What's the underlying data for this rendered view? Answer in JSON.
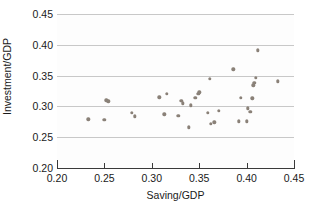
{
  "chart_data": {
    "type": "scatter",
    "title": "",
    "xlabel": "Saving/GDP",
    "ylabel": "Investment/GDP",
    "xlim": [
      0.2,
      0.45
    ],
    "ylim": [
      0.2,
      0.45
    ],
    "xticks": [
      "0.20",
      "0.25",
      "0.30",
      "0.35",
      "0.40",
      "0.45"
    ],
    "xtick_values": [
      0.2,
      0.25,
      0.3,
      0.35,
      0.4,
      0.45
    ],
    "yticks": [
      "0.20",
      "0.25",
      "0.30",
      "0.35",
      "0.40",
      "0.45"
    ],
    "ytick_values": [
      0.2,
      0.25,
      0.3,
      0.35,
      0.4,
      0.45
    ],
    "grid": "horizontal",
    "legend": null,
    "marker_color": "#8a8178",
    "points": [
      {
        "x": 0.233,
        "y": 0.279
      },
      {
        "x": 0.25,
        "y": 0.278
      },
      {
        "x": 0.252,
        "y": 0.31
      },
      {
        "x": 0.254,
        "y": 0.308
      },
      {
        "x": 0.279,
        "y": 0.29
      },
      {
        "x": 0.282,
        "y": 0.284
      },
      {
        "x": 0.308,
        "y": 0.315
      },
      {
        "x": 0.313,
        "y": 0.287
      },
      {
        "x": 0.316,
        "y": 0.32
      },
      {
        "x": 0.328,
        "y": 0.285
      },
      {
        "x": 0.331,
        "y": 0.309
      },
      {
        "x": 0.333,
        "y": 0.305
      },
      {
        "x": 0.339,
        "y": 0.266
      },
      {
        "x": 0.341,
        "y": 0.302
      },
      {
        "x": 0.346,
        "y": 0.314
      },
      {
        "x": 0.349,
        "y": 0.32
      },
      {
        "x": 0.35,
        "y": 0.323
      },
      {
        "x": 0.359,
        "y": 0.29
      },
      {
        "x": 0.361,
        "y": 0.345
      },
      {
        "x": 0.362,
        "y": 0.272
      },
      {
        "x": 0.366,
        "y": 0.274
      },
      {
        "x": 0.371,
        "y": 0.293
      },
      {
        "x": 0.386,
        "y": 0.36
      },
      {
        "x": 0.392,
        "y": 0.276
      },
      {
        "x": 0.394,
        "y": 0.314
      },
      {
        "x": 0.4,
        "y": 0.276
      },
      {
        "x": 0.401,
        "y": 0.297
      },
      {
        "x": 0.404,
        "y": 0.291
      },
      {
        "x": 0.406,
        "y": 0.313
      },
      {
        "x": 0.407,
        "y": 0.334
      },
      {
        "x": 0.408,
        "y": 0.338
      },
      {
        "x": 0.41,
        "y": 0.346
      },
      {
        "x": 0.412,
        "y": 0.391
      },
      {
        "x": 0.433,
        "y": 0.341
      }
    ]
  }
}
